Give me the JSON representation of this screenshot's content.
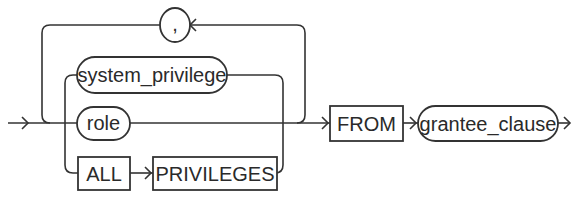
{
  "diagram": {
    "type": "railroad-syntax-diagram",
    "separator": {
      "label": ","
    },
    "choices": [
      {
        "label": "system_privilege",
        "kind": "nonterminal"
      },
      {
        "label": "role",
        "kind": "nonterminal"
      },
      {
        "label": "ALL",
        "kind": "keyword"
      },
      {
        "label": "PRIVILEGES",
        "kind": "keyword"
      }
    ],
    "from_keyword": {
      "label": "FROM",
      "kind": "keyword"
    },
    "grantee": {
      "label": "grantee_clause",
      "kind": "nonterminal"
    },
    "colors": {
      "line": "#333333",
      "text": "#2a2a2a",
      "background": "#ffffff"
    }
  }
}
